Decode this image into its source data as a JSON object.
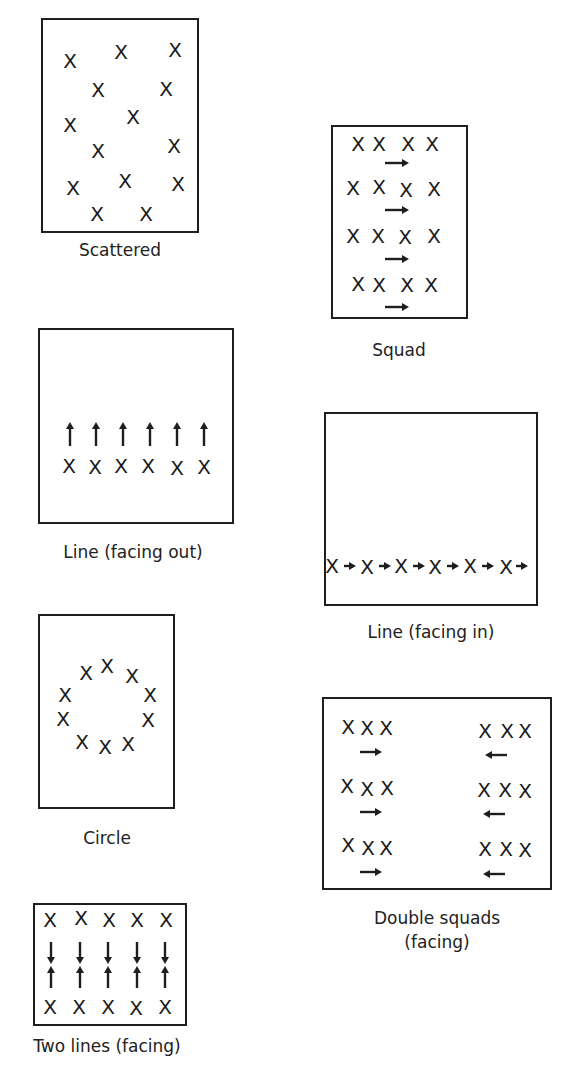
{
  "figure": {
    "panels": [
      {
        "id": "scattered",
        "label": "Scattered",
        "box": {
          "x": 41,
          "y": 18,
          "w": 158,
          "h": 215
        },
        "label_pos": {
          "x": 120,
          "y": 250
        },
        "players": [
          [
            70,
            61
          ],
          [
            121,
            52
          ],
          [
            175,
            50
          ],
          [
            98,
            90
          ],
          [
            166,
            89
          ],
          [
            70,
            125
          ],
          [
            133,
            117
          ],
          [
            98,
            151
          ],
          [
            174,
            146
          ],
          [
            73,
            188
          ],
          [
            125,
            181
          ],
          [
            178,
            184
          ],
          [
            97,
            214
          ],
          [
            146,
            214
          ]
        ],
        "arrows": []
      },
      {
        "id": "squad",
        "label": "Squad",
        "box": {
          "x": 331,
          "y": 125,
          "w": 137,
          "h": 194
        },
        "label_pos": {
          "x": 399,
          "y": 350
        },
        "players": [
          [
            358,
            144
          ],
          [
            379,
            144
          ],
          [
            408,
            144
          ],
          [
            432,
            144
          ],
          [
            353,
            188
          ],
          [
            379,
            187
          ],
          [
            406,
            190
          ],
          [
            434,
            189
          ],
          [
            353,
            236
          ],
          [
            378,
            236
          ],
          [
            405,
            237
          ],
          [
            434,
            236
          ],
          [
            358,
            284
          ],
          [
            379,
            285
          ],
          [
            407,
            285
          ],
          [
            431,
            285
          ]
        ],
        "arrows": [
          {
            "x": 397,
            "y": 163,
            "dir": "right",
            "len": 24
          },
          {
            "x": 397,
            "y": 210,
            "dir": "right",
            "len": 24
          },
          {
            "x": 397,
            "y": 259,
            "dir": "right",
            "len": 24
          },
          {
            "x": 397,
            "y": 307,
            "dir": "right",
            "len": 24
          }
        ]
      },
      {
        "id": "line-facing-out",
        "label": "Line (facing out)",
        "box": {
          "x": 38,
          "y": 328,
          "w": 196,
          "h": 196
        },
        "label_pos": {
          "x": 133,
          "y": 552
        },
        "players": [
          [
            69,
            466
          ],
          [
            95,
            467
          ],
          [
            121,
            466
          ],
          [
            148,
            466
          ],
          [
            177,
            468
          ],
          [
            204,
            467
          ]
        ],
        "arrows": [
          {
            "x": 70,
            "y": 434,
            "dir": "up",
            "len": 24
          },
          {
            "x": 96,
            "y": 434,
            "dir": "up",
            "len": 24
          },
          {
            "x": 123,
            "y": 434,
            "dir": "up",
            "len": 24
          },
          {
            "x": 150,
            "y": 434,
            "dir": "up",
            "len": 24
          },
          {
            "x": 177,
            "y": 434,
            "dir": "up",
            "len": 24
          },
          {
            "x": 204,
            "y": 434,
            "dir": "up",
            "len": 24
          }
        ]
      },
      {
        "id": "line-facing-in",
        "label": "Line (facing in)",
        "box": {
          "x": 324,
          "y": 412,
          "w": 214,
          "h": 194
        },
        "label_pos": {
          "x": 431,
          "y": 632
        },
        "players": [
          [
            332,
            566
          ],
          [
            367,
            567
          ],
          [
            401,
            566
          ],
          [
            435,
            567
          ],
          [
            470,
            566
          ],
          [
            506,
            567
          ]
        ],
        "arrows": [
          {
            "x": 350,
            "y": 566,
            "dir": "right",
            "len": 12
          },
          {
            "x": 385,
            "y": 566,
            "dir": "right",
            "len": 12
          },
          {
            "x": 419,
            "y": 566,
            "dir": "right",
            "len": 12
          },
          {
            "x": 453,
            "y": 566,
            "dir": "right",
            "len": 12
          },
          {
            "x": 488,
            "y": 566,
            "dir": "right",
            "len": 12
          },
          {
            "x": 522,
            "y": 566,
            "dir": "right",
            "len": 12
          }
        ]
      },
      {
        "id": "circle",
        "label": "Circle",
        "box": {
          "x": 38,
          "y": 614,
          "w": 137,
          "h": 195
        },
        "label_pos": {
          "x": 107,
          "y": 838
        },
        "players": [
          [
            86,
            673
          ],
          [
            107,
            666
          ],
          [
            132,
            676
          ],
          [
            65,
            695
          ],
          [
            150,
            695
          ],
          [
            63,
            719
          ],
          [
            148,
            720
          ],
          [
            82,
            742
          ],
          [
            105,
            747
          ],
          [
            128,
            744
          ]
        ],
        "arrows": []
      },
      {
        "id": "double-squads-facing",
        "label": "Double squads",
        "label_line2": "(facing)",
        "box": {
          "x": 322,
          "y": 697,
          "w": 230,
          "h": 193
        },
        "label_pos": {
          "x": 437,
          "y": 918
        },
        "players": [
          [
            348,
            727
          ],
          [
            367,
            728
          ],
          [
            386,
            728
          ],
          [
            485,
            731
          ],
          [
            507,
            731
          ],
          [
            525,
            731
          ],
          [
            347,
            786
          ],
          [
            367,
            789
          ],
          [
            387,
            788
          ],
          [
            484,
            790
          ],
          [
            505,
            790
          ],
          [
            525,
            791
          ],
          [
            348,
            845
          ],
          [
            368,
            848
          ],
          [
            386,
            848
          ],
          [
            485,
            849
          ],
          [
            506,
            849
          ],
          [
            525,
            850
          ]
        ],
        "arrows": [
          {
            "x": 371,
            "y": 752,
            "dir": "right",
            "len": 22
          },
          {
            "x": 496,
            "y": 755,
            "dir": "left",
            "len": 22
          },
          {
            "x": 371,
            "y": 812,
            "dir": "right",
            "len": 22
          },
          {
            "x": 494,
            "y": 814,
            "dir": "left",
            "len": 22
          },
          {
            "x": 371,
            "y": 872,
            "dir": "right",
            "len": 22
          },
          {
            "x": 494,
            "y": 874,
            "dir": "left",
            "len": 22
          }
        ]
      },
      {
        "id": "two-lines-facing",
        "label": "Two lines (facing)",
        "box": {
          "x": 33,
          "y": 903,
          "w": 154,
          "h": 123
        },
        "label_pos": {
          "x": 107,
          "y": 1046
        },
        "players": [
          [
            50,
            920
          ],
          [
            81,
            918
          ],
          [
            109,
            920
          ],
          [
            137,
            920
          ],
          [
            166,
            920
          ],
          [
            50,
            1007
          ],
          [
            79,
            1007
          ],
          [
            108,
            1007
          ],
          [
            136,
            1008
          ],
          [
            165,
            1007
          ]
        ],
        "arrows": [
          {
            "x": 51,
            "y": 953,
            "dir": "down",
            "len": 22
          },
          {
            "x": 80,
            "y": 953,
            "dir": "down",
            "len": 22
          },
          {
            "x": 108,
            "y": 953,
            "dir": "down",
            "len": 22
          },
          {
            "x": 137,
            "y": 953,
            "dir": "down",
            "len": 22
          },
          {
            "x": 165,
            "y": 953,
            "dir": "down",
            "len": 22
          },
          {
            "x": 51,
            "y": 977,
            "dir": "up",
            "len": 22
          },
          {
            "x": 80,
            "y": 977,
            "dir": "up",
            "len": 22
          },
          {
            "x": 108,
            "y": 977,
            "dir": "up",
            "len": 22
          },
          {
            "x": 137,
            "y": 977,
            "dir": "up",
            "len": 22
          },
          {
            "x": 165,
            "y": 977,
            "dir": "up",
            "len": 22
          }
        ]
      }
    ],
    "symbols": {
      "player": "X",
      "facing_arrow": "arrow-icon"
    },
    "colors": {
      "ink": "#1e1e1e",
      "background": "#ffffff"
    }
  }
}
